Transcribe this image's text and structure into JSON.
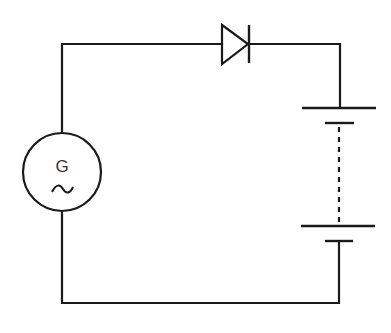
{
  "diagram": {
    "type": "circuit",
    "title": "",
    "components": [
      {
        "id": "generator",
        "kind": "ac-generator",
        "label": "G",
        "symbol": "~"
      },
      {
        "id": "diode",
        "kind": "diode",
        "orientation": "forward, pointing right"
      },
      {
        "id": "battery",
        "kind": "multi-cell-battery",
        "cells_shown": 2,
        "continuation": "dashed"
      }
    ],
    "connections": [
      "generator top -> diode anode",
      "diode cathode -> battery positive (top long plate)",
      "battery negative (bottom short plate) -> generator bottom"
    ]
  },
  "generator": {
    "label": "G",
    "symbol": "~"
  },
  "colors": {
    "stroke": "#1a1a1a",
    "background": "#ffffff"
  }
}
